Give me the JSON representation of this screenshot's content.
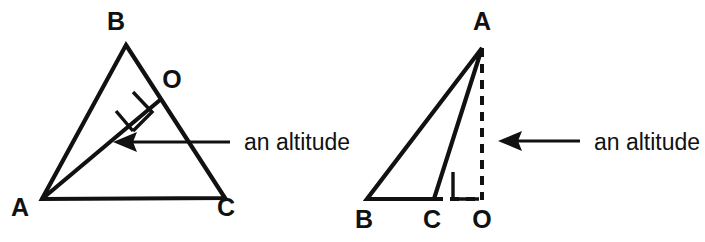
{
  "figure": {
    "background_color": "#ffffff",
    "ink_color": "#111111",
    "width": 705,
    "height": 242,
    "panels": [
      {
        "id": "left-panel",
        "name": "obtuse-triangle-interior-altitude",
        "triangle_vertices": [
          "A",
          "B",
          "C"
        ],
        "vertex_labels": [
          {
            "text": "B",
            "x": 124,
            "y": 30
          },
          {
            "text": "O",
            "x": 170,
            "y": 88
          },
          {
            "text": "A",
            "x": 14,
            "y": 216
          },
          {
            "text": "C",
            "x": 218,
            "y": 216
          }
        ],
        "triangle_points": "126,45 225,198 42,199",
        "altitude_from": "A",
        "altitude_foot": "O",
        "altitude_line": {
          "x1": 42,
          "y1": 199,
          "x2": 160,
          "y2": 100
        },
        "right_angle_at": "O",
        "annotation": {
          "text": "an altitude",
          "text_x": 244,
          "text_y": 148,
          "arrow_tip_x": 113,
          "arrow_tip_y": 142,
          "arrow_tail_x": 230,
          "arrow_tail_y": 142
        }
      },
      {
        "id": "right-panel",
        "name": "obtuse-triangle-exterior-altitude",
        "triangle_vertices": [
          "A",
          "B",
          "C"
        ],
        "vertex_labels": [
          {
            "text": "A",
            "x": 473,
            "y": 30
          },
          {
            "text": "B",
            "x": 356,
            "y": 228
          },
          {
            "text": "C",
            "x": 424,
            "y": 228
          },
          {
            "text": "O",
            "x": 473,
            "y": 228
          }
        ],
        "triangle_points": "482,48 367,199 434,199",
        "altitude_from": "A",
        "altitude_foot": "O",
        "altitude_line": {
          "x1": 482,
          "y1": 48,
          "x2": 482,
          "y2": 200
        },
        "altitude_style": "dashed",
        "base_extension": {
          "x1": 434,
          "y1": 199,
          "x2": 482,
          "y2": 199
        },
        "right_angle_at": "O",
        "annotation": {
          "text": "an altitude",
          "text_x": 594,
          "text_y": 148,
          "arrow_tip_x": 498,
          "arrow_tip_y": 141,
          "arrow_tail_x": 580,
          "arrow_tail_y": 141
        }
      }
    ]
  }
}
